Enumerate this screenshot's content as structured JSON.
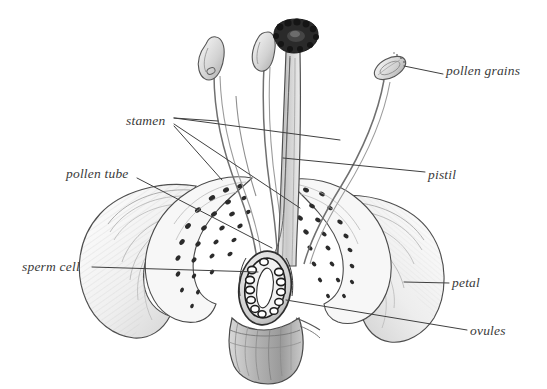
{
  "diagram": {
    "medium": "pencil illustration",
    "background_color": "#ffffff",
    "ink_color": "#3a3a3a",
    "leader_line_color": "#404040",
    "labels": [
      {
        "id": "pollen-grains",
        "text": "pollen grains",
        "x": 446,
        "y": 72,
        "align": "left",
        "leader": [
          [
            443,
            74
          ],
          [
            418,
            68
          ],
          [
            398,
            66
          ]
        ]
      },
      {
        "id": "stamen",
        "text": "stamen",
        "x": 126,
        "y": 122,
        "align": "left",
        "leader": [
          [
            172,
            119
          ],
          [
            215,
            121
          ]
        ]
      },
      {
        "id": "pistil",
        "text": "pistil",
        "x": 428,
        "y": 176,
        "align": "left",
        "leader": [
          [
            425,
            172
          ],
          [
            380,
            163
          ]
        ]
      },
      {
        "id": "pollen-tube",
        "text": "pollen tube",
        "x": 66,
        "y": 175,
        "align": "left",
        "leader": [
          [
            138,
            178
          ],
          [
            262,
            233
          ]
        ]
      },
      {
        "id": "sperm-cell",
        "text": "sperm cell",
        "x": 22,
        "y": 270,
        "align": "left",
        "leader": [
          [
            92,
            267
          ],
          [
            257,
            272
          ]
        ]
      },
      {
        "id": "petal",
        "text": "petal",
        "x": 452,
        "y": 287,
        "align": "left",
        "leader": [
          [
            449,
            283
          ],
          [
            408,
            283
          ]
        ]
      },
      {
        "id": "ovules",
        "text": "ovules",
        "x": 470,
        "y": 334,
        "align": "left",
        "leader": [
          [
            467,
            330
          ],
          [
            283,
            299
          ]
        ]
      }
    ],
    "parts": {
      "stigma": "stigma",
      "style": "style",
      "ovary": "ovary",
      "anther_left": "anther",
      "anther_mid": "anther",
      "anther_right": "anther",
      "filament": "filament",
      "receptacle": "receptacle",
      "stem": "stem",
      "petal_left": "petal",
      "petal_right": "petal",
      "petal_inner_left": "petal",
      "petal_inner_right": "petal"
    }
  }
}
